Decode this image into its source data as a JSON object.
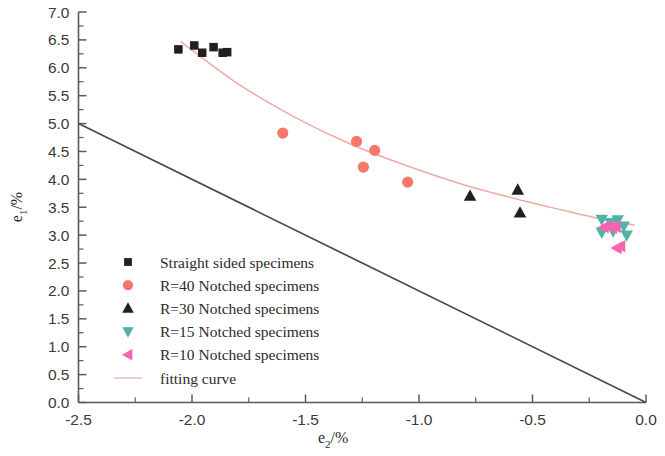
{
  "chart_data": {
    "type": "scatter",
    "title": "",
    "xlabel": "e2/%",
    "ylabel": "e1/%",
    "xlabel_base": "e",
    "xlabel_sub": "2",
    "xlabel_unit": "/%",
    "ylabel_base": "e",
    "ylabel_sub": "1",
    "ylabel_unit": "/%",
    "xlim": [
      -2.5,
      0.0
    ],
    "ylim": [
      0.0,
      7.0
    ],
    "xticks": [
      -2.5,
      -2.0,
      -1.5,
      -1.0,
      -0.5,
      0.0
    ],
    "xtick_labels": [
      "-2.5",
      "-2.0",
      "-1.5",
      "-1.0",
      "-0.5",
      "0.0"
    ],
    "yticks": [
      0.0,
      0.5,
      1.0,
      1.5,
      2.0,
      2.5,
      3.0,
      3.5,
      4.0,
      4.5,
      5.0,
      5.5,
      6.0,
      6.5,
      7.0
    ],
    "ytick_labels": [
      "0.0",
      "0.5",
      "1.0",
      "1.5",
      "2.0",
      "2.5",
      "3.0",
      "3.5",
      "4.0",
      "4.5",
      "5.0",
      "5.5",
      "6.0",
      "6.5",
      "7.0"
    ],
    "grid": false,
    "legend_position": "lower-left",
    "series": [
      {
        "name": "Straight sided specimens",
        "marker": "square",
        "color": "#231f20",
        "points": [
          {
            "x": -2.06,
            "y": 6.33
          },
          {
            "x": -1.99,
            "y": 6.4
          },
          {
            "x": -1.955,
            "y": 6.27
          },
          {
            "x": -1.905,
            "y": 6.37
          },
          {
            "x": -1.865,
            "y": 6.27
          },
          {
            "x": -1.845,
            "y": 6.28
          }
        ]
      },
      {
        "name": "R=40 Notched specimens",
        "marker": "circle",
        "color": "#f7776a",
        "points": [
          {
            "x": -1.6,
            "y": 4.83
          },
          {
            "x": -1.275,
            "y": 4.68
          },
          {
            "x": -1.245,
            "y": 4.22
          },
          {
            "x": -1.195,
            "y": 4.52
          },
          {
            "x": -1.05,
            "y": 3.95
          }
        ]
      },
      {
        "name": "R=30 Notched specimens",
        "marker": "triangle-up",
        "color": "#231f20",
        "points": [
          {
            "x": -0.775,
            "y": 3.7
          },
          {
            "x": -0.565,
            "y": 3.81
          },
          {
            "x": -0.555,
            "y": 3.4
          }
        ]
      },
      {
        "name": "R=15 Notched specimens",
        "marker": "triangle-down",
        "color": "#4fb3a8",
        "points": [
          {
            "x": -0.195,
            "y": 3.28
          },
          {
            "x": -0.155,
            "y": 3.22
          },
          {
            "x": -0.125,
            "y": 3.27
          },
          {
            "x": -0.195,
            "y": 3.05
          },
          {
            "x": -0.145,
            "y": 3.07
          },
          {
            "x": -0.098,
            "y": 3.16
          },
          {
            "x": -0.085,
            "y": 3.0
          }
        ]
      },
      {
        "name": "R=10 Notched specimens",
        "marker": "triangle-left",
        "color": "#f964ae",
        "points": [
          {
            "x": -0.185,
            "y": 3.14
          },
          {
            "x": -0.165,
            "y": 3.16
          },
          {
            "x": -0.148,
            "y": 3.13
          },
          {
            "x": -0.132,
            "y": 3.15
          },
          {
            "x": -0.128,
            "y": 2.77
          },
          {
            "x": -0.112,
            "y": 2.8
          }
        ]
      },
      {
        "name": "fitting curve",
        "marker": "line",
        "color": "#f0aaa6",
        "points": [
          {
            "x": -2.05,
            "y": 6.47
          },
          {
            "x": -1.8,
            "y": 5.72
          },
          {
            "x": -1.55,
            "y": 5.12
          },
          {
            "x": -1.3,
            "y": 4.63
          },
          {
            "x": -1.05,
            "y": 4.24
          },
          {
            "x": -0.8,
            "y": 3.9
          },
          {
            "x": -0.6,
            "y": 3.68
          },
          {
            "x": -0.4,
            "y": 3.48
          },
          {
            "x": -0.2,
            "y": 3.29
          },
          {
            "x": -0.05,
            "y": 3.18
          }
        ]
      },
      {
        "name": "limit line",
        "marker": "line",
        "color": "#4a4a4a",
        "points": [
          {
            "x": -2.5,
            "y": 5.0
          },
          {
            "x": 0.0,
            "y": 0.0
          }
        ]
      }
    ],
    "legend_entries": [
      {
        "label": "Straight sided specimens",
        "marker": "square",
        "color": "#231f20"
      },
      {
        "label": "R=40 Notched specimens",
        "marker": "circle",
        "color": "#f7776a"
      },
      {
        "label": "R=30 Notched specimens",
        "marker": "triangle-up",
        "color": "#231f20"
      },
      {
        "label": "R=15 Notched specimens",
        "marker": "triangle-down",
        "color": "#4fb3a8"
      },
      {
        "label": "R=10 Notched specimens",
        "marker": "triangle-left",
        "color": "#f964ae"
      },
      {
        "label": "fitting curve",
        "marker": "line",
        "color": "#e7b9b6"
      }
    ]
  }
}
